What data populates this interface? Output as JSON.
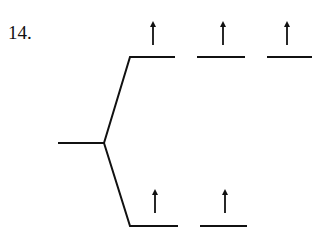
{
  "problem": {
    "number": "14."
  },
  "diagram": {
    "type": "orbital-splitting-diagram",
    "levels": {
      "degenerate": {
        "orbitals": 1,
        "electrons": []
      },
      "upper": {
        "orbitals": 3,
        "electrons": [
          "up",
          "up",
          "up"
        ]
      },
      "lower": {
        "orbitals": 2,
        "electrons": [
          "up",
          "up"
        ]
      }
    },
    "colors": {
      "line": "#111111"
    }
  }
}
